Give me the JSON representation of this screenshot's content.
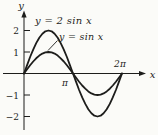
{
  "figure": {
    "background": "#fbfbf8",
    "ink_color": "#1d1d1b"
  },
  "axes": {
    "x_label": "x",
    "y_label": "y",
    "x_ticks": [
      {
        "value": 3.1416,
        "label": "π"
      },
      {
        "value": 6.2832,
        "label": "2π"
      }
    ],
    "y_ticks": [
      {
        "value": 2,
        "label": "2"
      },
      {
        "value": 1,
        "label": "1"
      },
      {
        "value": -1,
        "label": "−1"
      },
      {
        "value": -2,
        "label": "−2"
      }
    ]
  },
  "annotations": {
    "curve1_label": "y = 2 sin x",
    "curve2_label": "y = sin x"
  },
  "chart_data": {
    "type": "line",
    "title": "",
    "xlabel": "x",
    "ylabel": "y",
    "xlim": [
      0,
      6.2832
    ],
    "ylim": [
      -2,
      2
    ],
    "grid": false,
    "legend": "inline-annotations",
    "x_tick_labels": [
      "π",
      "2π"
    ],
    "y_tick_labels": [
      "2",
      "1",
      "−1",
      "−2"
    ],
    "x": [
      0,
      0.196,
      0.393,
      0.589,
      0.785,
      0.982,
      1.178,
      1.374,
      1.571,
      1.767,
      1.963,
      2.16,
      2.356,
      2.553,
      2.749,
      2.945,
      3.142,
      3.338,
      3.534,
      3.731,
      3.927,
      4.123,
      4.32,
      4.516,
      4.712,
      4.909,
      5.105,
      5.301,
      5.498,
      5.694,
      5.89,
      6.087,
      6.283
    ],
    "series": [
      {
        "name": "y = 2 sin x",
        "values": [
          0,
          0.39,
          0.766,
          1.112,
          1.414,
          1.662,
          1.848,
          1.962,
          2,
          1.962,
          1.848,
          1.662,
          1.414,
          1.112,
          0.766,
          0.39,
          0,
          -0.39,
          -0.766,
          -1.112,
          -1.414,
          -1.662,
          -1.848,
          -1.962,
          -2,
          -1.962,
          -1.848,
          -1.662,
          -1.414,
          -1.112,
          -0.766,
          -0.39,
          0
        ]
      },
      {
        "name": "y = sin x",
        "values": [
          0,
          0.195,
          0.383,
          0.556,
          0.707,
          0.831,
          0.924,
          0.981,
          1,
          0.981,
          0.924,
          0.831,
          0.707,
          0.556,
          0.383,
          0.195,
          0,
          -0.195,
          -0.383,
          -0.556,
          -0.707,
          -0.831,
          -0.924,
          -0.981,
          -1,
          -0.981,
          -0.924,
          -0.831,
          -0.707,
          -0.556,
          -0.383,
          -0.195,
          0
        ]
      }
    ]
  }
}
